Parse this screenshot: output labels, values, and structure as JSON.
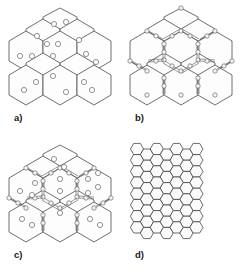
{
  "figure": {
    "background_color": "#ffffff",
    "line_color": "#4a4a4a",
    "label_color": "#1a1a1a",
    "width": 243,
    "height": 274,
    "layout": "2x2 panel grid"
  },
  "panels": [
    {
      "id": "a",
      "label": "a)",
      "description": "Honeycomb cluster of large pointy-top hexagonal cells, each cell containing small open circles",
      "cell_count": 12,
      "cell_fill": "#fdfdfd",
      "cell_stroke": "#4a4a4a",
      "marker_shape": "circle",
      "marker_fill": "#ffffff",
      "marker_stroke": "#666666",
      "markers_per_cell": 2,
      "edge_decoration": "none"
    },
    {
      "id": "b",
      "label": "b)",
      "description": "Same honeycomb cluster of large hexagonal cells with chains of small beads decorating the shared cell boundaries; cell interiors empty",
      "cell_count": 12,
      "cell_fill": "#fdfdfd",
      "cell_stroke": "#4a4a4a",
      "marker_shape": "none",
      "markers_per_cell": 0,
      "edge_decoration": "bead-chain",
      "bead_fill": "#f4f4f4",
      "bead_stroke": "#555555"
    },
    {
      "id": "c",
      "label": "c)",
      "description": "Combination of a) and b): large hexagonal cells with interior circles and bead-chain decorated boundaries",
      "cell_count": 12,
      "cell_fill": "#fdfdfd",
      "cell_stroke": "#4a4a4a",
      "marker_shape": "circle",
      "marker_fill": "#ffffff",
      "marker_stroke": "#666666",
      "markers_per_cell": 2,
      "edge_decoration": "bead-chain",
      "bead_fill": "#f4f4f4",
      "bead_stroke": "#555555"
    },
    {
      "id": "d",
      "label": "d)",
      "description": "Dense fine-scale honeycomb mesh of small flat-top hexagons filling a square region",
      "columns": 7,
      "rows": 8,
      "cell_fill": "#fbfbfb",
      "cell_stroke": "#3a3a3a",
      "marker_shape": "none",
      "edge_decoration": "none"
    }
  ]
}
